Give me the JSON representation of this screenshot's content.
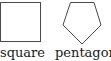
{
  "figure": {
    "items": [
      {
        "shape": "square",
        "label": "square",
        "stroke": "#4a4a4a",
        "fill": "#ffffff"
      },
      {
        "shape": "pentagon",
        "label": "pentagon",
        "stroke": "#4a4a4a",
        "fill": "#ffffff"
      }
    ]
  }
}
